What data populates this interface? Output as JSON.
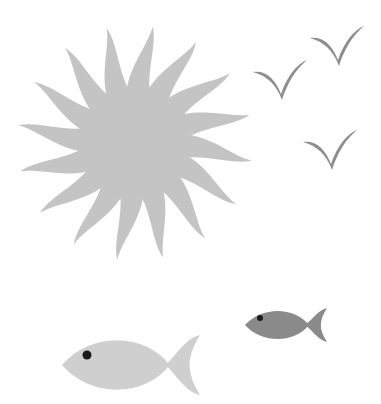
{
  "scene": {
    "background": "#ffffff",
    "sun": {
      "center": [
        135,
        143
      ],
      "body_radius": 46,
      "ray_count": 16,
      "ray_length": 118,
      "color": "#c4c4c4"
    },
    "birds": [
      {
        "position": [
          350,
          46
        ],
        "scale": 1.0,
        "color": "#8e8e8e"
      },
      {
        "position": [
          293,
          80
        ],
        "scale": 1.0,
        "color": "#8e8e8e"
      },
      {
        "position": [
          343,
          150
        ],
        "scale": 1.0,
        "color": "#8e8e8e"
      }
    ],
    "fishes": [
      {
        "label": "large-fish",
        "position": [
          62,
          335
        ],
        "size": [
          138,
          60
        ],
        "body_color": "#cfcfcf",
        "eye": [
          87,
          355
        ],
        "eye_color": "#1a1a1a"
      },
      {
        "label": "small-fish",
        "position": [
          245,
          308
        ],
        "size": [
          82,
          34
        ],
        "body_color": "#8a8a8a",
        "eye": [
          260,
          318
        ],
        "eye_color": "#1a1a1a"
      }
    ]
  }
}
